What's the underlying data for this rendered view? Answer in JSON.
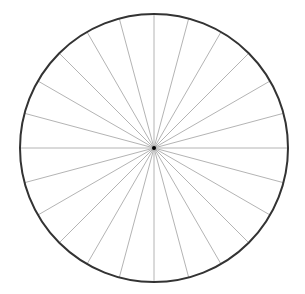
{
  "diagram": {
    "type": "radial-spoke-circle",
    "center": {
      "x": 154,
      "y": 148
    },
    "radius": 134,
    "spoke_count": 24,
    "spoke_angle_step_deg": 15,
    "colors": {
      "background": "#ffffff",
      "circle_stroke": "#333333",
      "spoke_stroke": "#b4b4b4",
      "center_dot": "#000000"
    },
    "circle_stroke_width": 2,
    "spoke_stroke_width": 1,
    "center_dot_radius": 2
  }
}
